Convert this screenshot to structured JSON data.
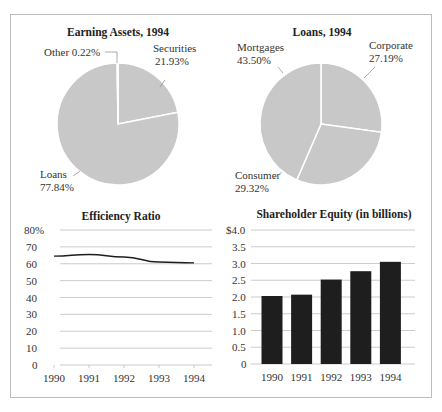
{
  "chart_data": [
    {
      "type": "pie",
      "title": "Earning Assets, 1994",
      "slices": [
        {
          "label": "Securities",
          "value": 21.93,
          "display": "21.93%"
        },
        {
          "label": "Loans",
          "value": 77.84,
          "display": "77.84%"
        },
        {
          "label": "Other",
          "value": 0.22,
          "display": "Other 0.22%"
        }
      ]
    },
    {
      "type": "pie",
      "title": "Loans, 1994",
      "slices": [
        {
          "label": "Corporate",
          "value": 27.19,
          "display": "27.19%"
        },
        {
          "label": "Consumer",
          "value": 29.32,
          "display": "29.32%"
        },
        {
          "label": "Mortgages",
          "value": 43.5,
          "display": "43.50%"
        }
      ]
    },
    {
      "type": "line",
      "title": "Efficiency Ratio",
      "x": [
        "1990",
        "1991",
        "1992",
        "1993",
        "1994"
      ],
      "values": [
        64.5,
        65.5,
        64,
        61,
        60.5
      ],
      "yticks": [
        "0",
        "10",
        "20",
        "30",
        "40",
        "50",
        "60",
        "70",
        "80%"
      ],
      "ylim": [
        0,
        80
      ],
      "grid": true,
      "xlabel": "",
      "ylabel": ""
    },
    {
      "type": "bar",
      "title": "Shareholder Equity (in billions)",
      "categories": [
        "1990",
        "1991",
        "1992",
        "1993",
        "1994"
      ],
      "values": [
        2.03,
        2.07,
        2.52,
        2.77,
        3.05
      ],
      "yticks": [
        "0",
        "0.5",
        "1.0",
        "1.5",
        "2.0",
        "2.5",
        "3.0",
        "3.5",
        "$4.0"
      ],
      "ylim": [
        0,
        4.0
      ],
      "grid": true,
      "xlabel": "",
      "ylabel": ""
    }
  ],
  "colors": {
    "pie_fill": "#c8c8c8",
    "bar_fill": "#1e1e1e",
    "line": "#1e1e1e",
    "grid": "#aaaaaa",
    "text": "#333333"
  }
}
